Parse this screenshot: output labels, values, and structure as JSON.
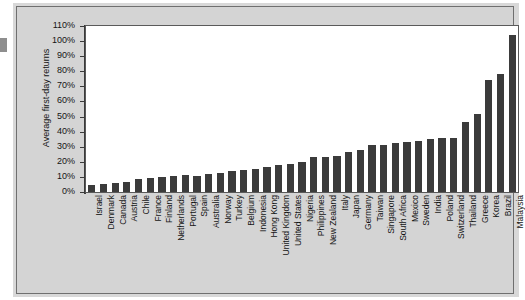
{
  "figure": {
    "edge_mark_name": "scan-edge-artifact"
  },
  "chart_data": {
    "type": "bar",
    "title": "",
    "subtitle": "",
    "xlabel": "",
    "ylabel": "Average first-day returns",
    "ylim": [
      0,
      110
    ],
    "ytick_labels": [
      "110%",
      "100%",
      "90%",
      "80%",
      "70%",
      "60%",
      "50%",
      "40%",
      "30%",
      "20%",
      "10%",
      "0%"
    ],
    "ytick_values": [
      110,
      100,
      90,
      80,
      70,
      60,
      50,
      40,
      30,
      20,
      10,
      0
    ],
    "grid": false,
    "legend": false,
    "legend_position": "none",
    "bar_color": "#3b3b3b",
    "plot_background": "#ffffff",
    "figure_background": "#d4d4d4",
    "categories": [
      "Israel",
      "Denmark",
      "Canada",
      "Austria",
      "Chile",
      "France",
      "Finland",
      "Netherlands",
      "Portugal",
      "Spain",
      "Australia",
      "Norway",
      "Turkey",
      "Belgium",
      "Indonesia",
      "Hong Kong",
      "United Kingdom",
      "United States",
      "Nigeria",
      "Philippines",
      "New Zealand",
      "Italy",
      "Japan",
      "Germany",
      "Taiwan",
      "Singapore",
      "South Africa",
      "Mexico",
      "Sweden",
      "India",
      "Poland",
      "Switzerland",
      "Thailand",
      "Greece",
      "Korea",
      "Brazil",
      "Malaysia"
    ],
    "values": [
      4.5,
      5.4,
      6.3,
      6.5,
      8.8,
      9.5,
      10.1,
      10.7,
      11.1,
      10.9,
      12.1,
      12.6,
      13.6,
      14.6,
      15.5,
      16.3,
      17.9,
      18.8,
      19.9,
      23.5,
      23.3,
      24.1,
      26.4,
      27.7,
      31.1,
      31.4,
      32.7,
      33.0,
      34.1,
      35.3,
      35.6,
      36.1,
      46.7,
      51.7,
      74.3,
      78.5,
      104.1
    ]
  }
}
